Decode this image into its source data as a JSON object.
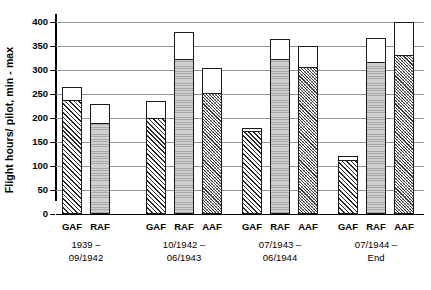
{
  "chart_data": {
    "type": "bar",
    "subtype": "floating-range-bar",
    "title": "",
    "xlabel": "",
    "ylabel": "Flight hours/ pilot, min - max",
    "ylim": [
      0,
      400
    ],
    "yticks": [
      0,
      50,
      100,
      150,
      200,
      250,
      300,
      350,
      400
    ],
    "ytick_labels": [
      "0",
      "50",
      "100",
      "150",
      "200",
      "250",
      "300",
      "350",
      "400"
    ],
    "grid": true,
    "legend": "none",
    "value_encoding": "Each bar spans from its min value (top of the patterned fill) to its max value (top of the white bar outline).",
    "categories": [
      "GAF",
      "RAF",
      "AAF"
    ],
    "groups": [
      {
        "label_line1": "1939 –",
        "label_line2": "09/1942",
        "bars": [
          {
            "category": "GAF",
            "pattern": "diagonal-hatch",
            "min": 235,
            "max": 265
          },
          {
            "category": "RAF",
            "pattern": "grey-stipple",
            "min": 188,
            "max": 230
          }
        ]
      },
      {
        "label_line1": "10/1942 –",
        "label_line2": "06/1943",
        "bars": [
          {
            "category": "GAF",
            "pattern": "diagonal-hatch",
            "min": 197,
            "max": 235
          },
          {
            "category": "RAF",
            "pattern": "grey-stipple",
            "min": 320,
            "max": 380
          },
          {
            "category": "AAF",
            "pattern": "cross-hatch",
            "min": 250,
            "max": 305
          }
        ]
      },
      {
        "label_line1": "07/1943 –",
        "label_line2": "06/1944",
        "bars": [
          {
            "category": "GAF",
            "pattern": "diagonal-hatch",
            "min": 170,
            "max": 180
          },
          {
            "category": "RAF",
            "pattern": "grey-stipple",
            "min": 320,
            "max": 365
          },
          {
            "category": "AAF",
            "pattern": "cross-hatch",
            "min": 305,
            "max": 350
          }
        ]
      },
      {
        "label_line1": "07/1944 –",
        "label_line2": "End",
        "bars": [
          {
            "category": "GAF",
            "pattern": "diagonal-hatch",
            "min": 110,
            "max": 120
          },
          {
            "category": "RAF",
            "pattern": "grey-stipple",
            "min": 315,
            "max": 367
          },
          {
            "category": "AAF",
            "pattern": "cross-hatch",
            "min": 330,
            "max": 400
          }
        ]
      }
    ],
    "colors": {
      "axis": "#000000",
      "gridline": "#959595",
      "bar_outline": "#1a1a1a",
      "grey_fill": "#cfcfcf",
      "hatch_stroke": "#2b2b2b",
      "background": "#ffffff"
    }
  }
}
